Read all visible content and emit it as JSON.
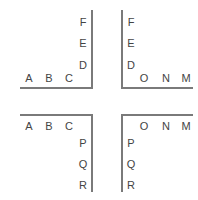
{
  "quadrants": {
    "top_left": {
      "horizontal": [
        "A",
        "B",
        "C"
      ],
      "vertical": [
        "F",
        "E",
        "D"
      ]
    },
    "top_right": {
      "vertical": [
        "F",
        "E",
        "D"
      ],
      "horizontal": [
        "O",
        "N",
        "M"
      ]
    },
    "bottom_left": {
      "horizontal": [
        "A",
        "B",
        "C"
      ],
      "vertical": [
        "P",
        "Q",
        "R"
      ]
    },
    "bottom_right": {
      "horizontal": [
        "O",
        "N",
        "M"
      ],
      "vertical": [
        "P",
        "Q",
        "R"
      ]
    }
  },
  "colors": {
    "line": "#7a7a7a",
    "text": "#444444"
  }
}
